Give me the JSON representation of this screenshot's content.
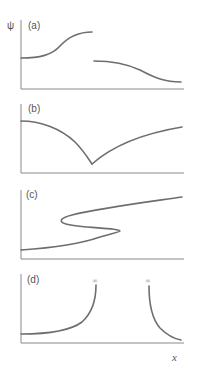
{
  "figure": {
    "y_axis_label": "ψ",
    "x_axis_label": "x",
    "colors": {
      "curve": "#6e6e6e",
      "axis": "#8a8a8a",
      "text": "#555555"
    },
    "panels": [
      {
        "id": "a",
        "label": "(a)",
        "description": "Discontinuous function: smooth rising curve then jump down to a smooth falling curve"
      },
      {
        "id": "b",
        "label": "(b)",
        "description": "Continuous function with a cusp (discontinuous derivative)"
      },
      {
        "id": "c",
        "label": "(c)",
        "description": "Multi-valued S-shaped curve"
      },
      {
        "id": "d",
        "label": "(d)",
        "description": "Function diverging to infinity at two points",
        "infinity_marks": [
          "∞",
          "∞"
        ]
      }
    ]
  }
}
